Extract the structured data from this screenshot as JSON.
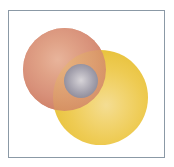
{
  "figure": {
    "caption": "",
    "background_color": "#ffffff",
    "frame": {
      "border_color": "#8b99a6",
      "border_width_px": 1,
      "fill_color": "#ffffff"
    },
    "spheres": [
      {
        "name": "salmon-sphere",
        "label": "Salmon sphere",
        "fill_color": "#d8917a",
        "highlight_color": "#e8b49b",
        "shadow_color": "#c4745c",
        "center_x": 65,
        "center_y": 69,
        "diameter": 83
      },
      {
        "name": "gold-sphere",
        "label": "Golden yellow sphere",
        "fill_color": "#eecb53",
        "highlight_color": "#f4dd93",
        "shadow_color": "#dfb62c",
        "center_x": 101,
        "center_y": 97,
        "diameter": 95
      },
      {
        "name": "gray-sphere",
        "label": "Gray sphere",
        "fill_color": "#a5a2ae",
        "highlight_color": "#d7d4d8",
        "shadow_color": "#7d7a88",
        "center_x": 81,
        "center_y": 81,
        "diameter": 34
      }
    ],
    "overlap": {
      "label": "Salmon over gold lens",
      "blend_color": "#c08063",
      "opacity": 0.78
    }
  }
}
